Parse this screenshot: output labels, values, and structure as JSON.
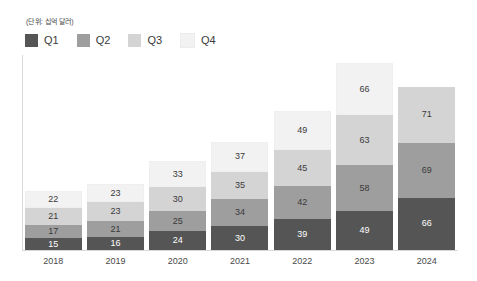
{
  "unit_note": "(단위: 십억 달러)",
  "legend": {
    "items": [
      {
        "label": "Q1",
        "color": "#555555"
      },
      {
        "label": "Q2",
        "color": "#9e9e9e"
      },
      {
        "label": "Q3",
        "color": "#d4d4d4"
      },
      {
        "label": "Q4",
        "color": "#f2f2f2"
      }
    ]
  },
  "chart_data": {
    "type": "bar",
    "subtype": "stacked-bar",
    "title": "",
    "subtitle": "",
    "xlabel": "",
    "ylabel": "",
    "unit": "(단위: 십억 달러)",
    "grid": false,
    "legend_position": "top-left",
    "categories": [
      "2018",
      "2019",
      "2020",
      "2021",
      "2022",
      "2023",
      "2024"
    ],
    "series": [
      {
        "name": "Q1",
        "color": "#555555",
        "values": [
          15,
          16,
          24,
          30,
          39,
          49,
          66
        ]
      },
      {
        "name": "Q2",
        "color": "#9e9e9e",
        "values": [
          17,
          21,
          25,
          34,
          42,
          58,
          69
        ]
      },
      {
        "name": "Q3",
        "color": "#d4d4d4",
        "values": [
          21,
          23,
          30,
          35,
          45,
          63,
          71
        ]
      },
      {
        "name": "Q4",
        "color": "#f2f2f2",
        "values": [
          22,
          23,
          33,
          37,
          49,
          66,
          null
        ]
      }
    ],
    "totals": [
      75,
      83,
      112,
      136,
      175,
      236,
      206
    ],
    "ylim": [
      0,
      236
    ]
  },
  "xaxis": {
    "ticks": [
      "2018",
      "2019",
      "2020",
      "2021",
      "2022",
      "2023",
      "2024"
    ]
  }
}
